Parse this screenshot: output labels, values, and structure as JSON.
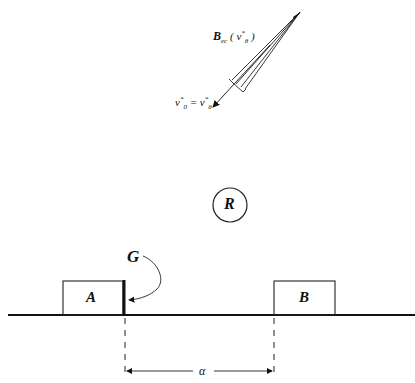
{
  "figure": {
    "kind": "physics-diagram",
    "colors": {
      "ink": "#111111",
      "background": "#ffffff"
    }
  },
  "beam": {
    "label_main": "B",
    "label_sub": "ec",
    "label_arg_open": "( ",
    "label_arg": "v",
    "label_arg_sup": "*",
    "label_arg_sub": "θ",
    "label_arg_close": " )"
  },
  "velocity": {
    "lhs": "v",
    "lhs_sup": "*",
    "lhs_sub": "0",
    "equals": "=",
    "rhs": "v",
    "rhs_sup": "*",
    "rhs_sub": "θ"
  },
  "reactor": {
    "label": "R"
  },
  "boxes": [
    {
      "id": "A",
      "label": "A"
    },
    {
      "id": "B",
      "label": "B"
    }
  ],
  "gate": {
    "label": "G"
  },
  "separation": {
    "label": "α"
  }
}
